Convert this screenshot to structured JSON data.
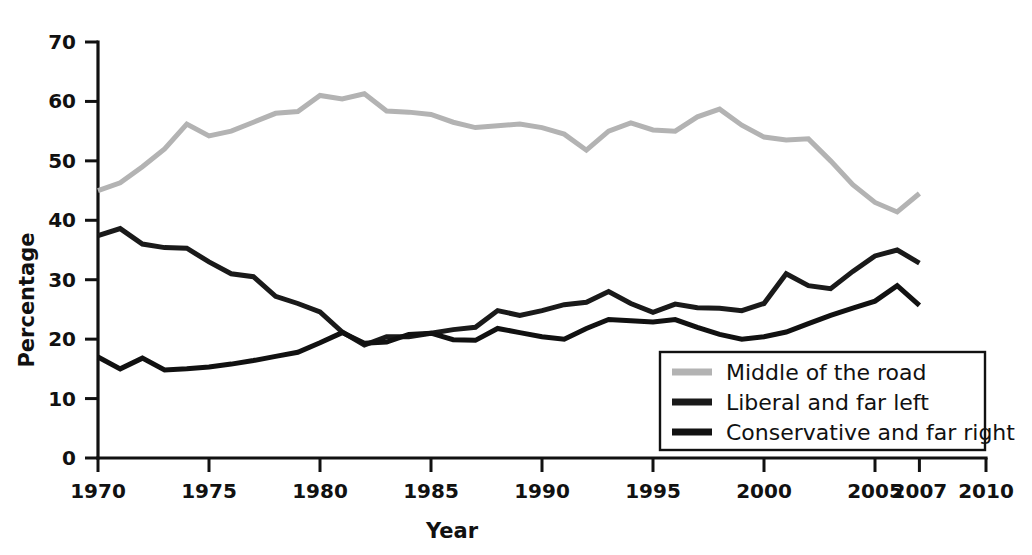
{
  "chart_data": {
    "type": "line",
    "title": "",
    "xlabel": "Year",
    "ylabel": "Percentage",
    "xlim": [
      1970,
      2010
    ],
    "ylim": [
      0,
      70
    ],
    "grid": false,
    "legend_position": "bottom-right",
    "x_ticks": [
      "1970",
      "1975",
      "1980",
      "1985",
      "1990",
      "1995",
      "2000",
      "2005",
      "2007",
      "2010"
    ],
    "x_tick_values": [
      1970,
      1975,
      1980,
      1985,
      1990,
      1995,
      2000,
      2005,
      2007,
      2010
    ],
    "y_ticks": [
      "0",
      "10",
      "20",
      "30",
      "40",
      "50",
      "60",
      "70"
    ],
    "y_tick_values": [
      0,
      10,
      20,
      30,
      40,
      50,
      60,
      70
    ],
    "x": [
      1970,
      1971,
      1972,
      1973,
      1974,
      1975,
      1976,
      1977,
      1978,
      1979,
      1980,
      1981,
      1982,
      1983,
      1984,
      1985,
      1986,
      1987,
      1988,
      1989,
      1990,
      1991,
      1992,
      1993,
      1994,
      1995,
      1996,
      1997,
      1998,
      1999,
      2000,
      2001,
      2002,
      2003,
      2004,
      2005,
      2006,
      2007
    ],
    "series": [
      {
        "name": "Middle of the road",
        "color": "#b3b3b3",
        "width": 5,
        "values": [
          45.0,
          46.3,
          49.0,
          52.0,
          56.2,
          54.2,
          55.0,
          56.5,
          58.0,
          58.3,
          61.0,
          60.4,
          61.3,
          58.4,
          58.2,
          57.8,
          56.5,
          55.6,
          55.9,
          56.2,
          55.6,
          54.5,
          51.8,
          55.0,
          56.4,
          55.2,
          55.0,
          57.4,
          58.7,
          56.0,
          54.0,
          53.5,
          53.7,
          50.0,
          46.0,
          43.0,
          41.4,
          44.5
        ]
      },
      {
        "name": "Liberal and far left",
        "color": "#1a1a1a",
        "width": 5,
        "values": [
          37.4,
          38.6,
          36.0,
          35.4,
          35.3,
          33.0,
          31.0,
          30.5,
          27.2,
          26.0,
          24.6,
          21.2,
          19.0,
          20.4,
          20.4,
          21.0,
          21.6,
          22.0,
          24.8,
          24.0,
          24.8,
          25.8,
          26.2,
          28.0,
          26.0,
          24.5,
          25.9,
          25.3,
          25.2,
          24.8,
          26.0,
          31.0,
          29.0,
          28.5,
          31.4,
          34.0,
          35.0,
          32.8
        ]
      },
      {
        "name": "Conservative and far right",
        "color": "#111111",
        "width": 5,
        "values": [
          17.0,
          15.0,
          16.8,
          14.8,
          15.0,
          15.3,
          15.8,
          16.4,
          17.1,
          17.8,
          19.4,
          21.1,
          19.3,
          19.5,
          20.8,
          21.0,
          19.9,
          19.8,
          21.8,
          21.1,
          20.4,
          20.0,
          21.8,
          23.3,
          23.1,
          22.9,
          23.3,
          22.0,
          20.8,
          20.0,
          20.4,
          21.2,
          22.6,
          24.0,
          25.2,
          26.4,
          29.0,
          25.7
        ]
      }
    ],
    "legend_entries": [
      {
        "label": "Middle of the road",
        "color": "#b3b3b3"
      },
      {
        "label": "Liberal and far left",
        "color": "#1a1a1a"
      },
      {
        "label": "Conservative and far right",
        "color": "#111111"
      }
    ]
  }
}
